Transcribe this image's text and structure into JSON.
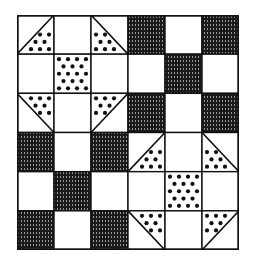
{
  "title": "Shoo-fly quilt block pattern",
  "colors": {
    "background": "#ffffff",
    "line": "#111111",
    "hatch": "#1a1a1a",
    "dot": "#111111"
  },
  "grid": {
    "rows": 6,
    "cols": 6,
    "legend": {
      "blank": "plain white square",
      "hatch": "dark vertically-hatched square",
      "dots": "polka-dot square",
      "tri-br": "dotted half-triangle, bottom-right",
      "tri-bl": "dotted half-triangle, bottom-left",
      "tri-tr": "dotted half-triangle, top-right",
      "tri-tl": "dotted half-triangle, top-left"
    },
    "cells": [
      [
        "tri-br",
        "blank",
        "tri-bl",
        "hatch",
        "blank",
        "hatch"
      ],
      [
        "blank",
        "dots",
        "blank",
        "blank",
        "hatch",
        "blank"
      ],
      [
        "tri-tr",
        "blank",
        "tri-tl",
        "hatch",
        "blank",
        "hatch"
      ],
      [
        "hatch",
        "blank",
        "hatch",
        "tri-br",
        "blank",
        "tri-bl"
      ],
      [
        "blank",
        "hatch",
        "blank",
        "blank",
        "dots",
        "blank"
      ],
      [
        "hatch",
        "blank",
        "hatch",
        "tri-tr",
        "blank",
        "tri-tl"
      ]
    ]
  }
}
